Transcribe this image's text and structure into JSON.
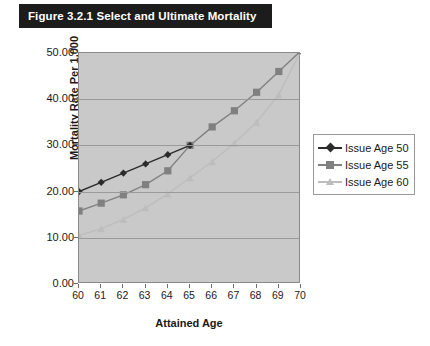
{
  "figure": {
    "banner_title": "Figure 3.2.1 Select and Ultimate Mortality"
  },
  "legend": {
    "position": "right",
    "entries": [
      {
        "label": "Issue Age 50",
        "color": "#2b2b2b",
        "marker": "diamond"
      },
      {
        "label": "Issue Age 55",
        "color": "#808080",
        "marker": "square"
      },
      {
        "label": "Issue Age 60",
        "color": "#bdbdbd",
        "marker": "triangle"
      }
    ]
  },
  "axes": {
    "y_tick_labels": [
      "50.00",
      "40.00",
      "30.00",
      "20.00",
      "10.00",
      "0.00"
    ],
    "x_tick_labels": [
      "60",
      "61",
      "62",
      "63",
      "64",
      "65",
      "66",
      "67",
      "68",
      "69",
      "70"
    ],
    "y_title": "Mortality Rate Per 1,000",
    "x_title": "Attained Age"
  },
  "colors": {
    "plot_background": "#c9c9c9",
    "gridline": "#9a9a9a",
    "banner_background": "#1c1c1c",
    "banner_text": "#ffffff",
    "series_50": "#2b2b2b",
    "series_55": "#808080",
    "series_60": "#bdbdbd"
  },
  "chart_data": {
    "type": "line",
    "title": "Figure 3.2.1 Select and Ultimate Mortality",
    "xlabel": "Attained Age",
    "ylabel": "Mortality Rate Per 1,000",
    "x": [
      60,
      61,
      62,
      63,
      64,
      65,
      66,
      67,
      68,
      69,
      70
    ],
    "xlim": [
      60,
      70
    ],
    "ylim": [
      0,
      50
    ],
    "yticks": [
      0,
      10,
      20,
      30,
      40,
      50
    ],
    "grid": true,
    "legend_position": "right",
    "series": [
      {
        "name": "Issue Age 50",
        "color": "#2b2b2b",
        "marker": "diamond",
        "x": [
          60,
          61,
          62,
          63,
          64,
          65
        ],
        "values": [
          20.0,
          22.0,
          24.0,
          26.0,
          28.0,
          30.0
        ]
      },
      {
        "name": "Issue Age 55",
        "color": "#808080",
        "marker": "square",
        "x": [
          60,
          61,
          62,
          63,
          64,
          65,
          66,
          67,
          68,
          69,
          70
        ],
        "values": [
          15.8,
          17.5,
          19.3,
          21.5,
          24.5,
          30.0,
          34.0,
          37.5,
          41.5,
          46.0,
          50.5
        ]
      },
      {
        "name": "Issue Age 60",
        "color": "#bdbdbd",
        "marker": "triangle",
        "x": [
          60,
          61,
          62,
          63,
          64,
          65,
          66,
          67,
          68,
          69,
          70
        ],
        "values": [
          10.5,
          12.0,
          14.0,
          16.5,
          19.5,
          23.0,
          26.5,
          30.5,
          35.0,
          41.0,
          50.5
        ]
      }
    ]
  }
}
